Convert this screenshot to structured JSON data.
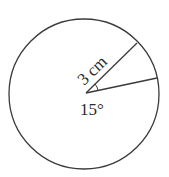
{
  "diagram": {
    "type": "circle-sector",
    "radius_label": "3 cm",
    "angle_label": "15°",
    "colors": {
      "stroke": "#3a3a3a",
      "text": "#2b2b2b",
      "background": "#ffffff"
    }
  }
}
